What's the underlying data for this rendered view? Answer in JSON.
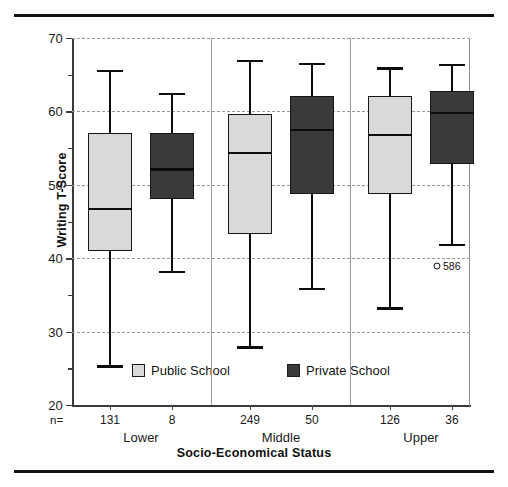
{
  "chart_data": {
    "type": "box",
    "title": "",
    "xlabel": "Socio-Economical Status",
    "ylabel": "Writing T-Score",
    "ylim": [
      20,
      70
    ],
    "ytick_labels": [
      "70",
      "60",
      "50",
      "40",
      "30",
      "20"
    ],
    "ytick_values": [
      70,
      60,
      50,
      40,
      30,
      20
    ],
    "yminor_values": [
      65,
      55,
      45,
      35,
      25
    ],
    "grid": "horizontal-dashed",
    "categories": [
      "Lower",
      "Middle",
      "Upper"
    ],
    "legend": {
      "position": "inside-bottom",
      "entries": [
        {
          "label": "Public School",
          "color": "#d9d9d9"
        },
        {
          "label": "Private School",
          "color": "#3a3a3a"
        }
      ]
    },
    "n_prefix": "n=",
    "series": [
      {
        "name": "Public School",
        "color": "#d9d9d9",
        "boxes": [
          {
            "group": "Lower",
            "n": "131",
            "min": 25.4,
            "q1": 41.0,
            "median": 46.7,
            "q3": 57.0,
            "max": 65.7
          },
          {
            "group": "Middle",
            "n": "249",
            "min": 28.0,
            "q1": 43.3,
            "median": 54.3,
            "q3": 59.7,
            "max": 67.0
          },
          {
            "group": "Upper",
            "n": "126",
            "min": 33.3,
            "q1": 48.8,
            "median": 56.8,
            "q3": 62.1,
            "max": 66.0
          }
        ]
      },
      {
        "name": "Private School",
        "color": "#3a3a3a",
        "boxes": [
          {
            "group": "Lower",
            "n": "8",
            "min": 38.3,
            "q1": 48.0,
            "median": 52.1,
            "q3": 57.0,
            "max": 62.5
          },
          {
            "group": "Middle",
            "n": "50",
            "min": 36.0,
            "q1": 48.8,
            "median": 57.5,
            "q3": 62.1,
            "max": 66.6
          },
          {
            "group": "Upper",
            "n": "36",
            "min": 42.0,
            "q1": 52.8,
            "median": 59.8,
            "q3": 62.8,
            "max": 66.5
          }
        ]
      }
    ],
    "outliers": [
      {
        "group": "Upper",
        "series": "Private School",
        "value": 39.0,
        "label": "586"
      }
    ],
    "group_separators": [
      "between Lower and Middle",
      "between Middle and Upper"
    ]
  }
}
